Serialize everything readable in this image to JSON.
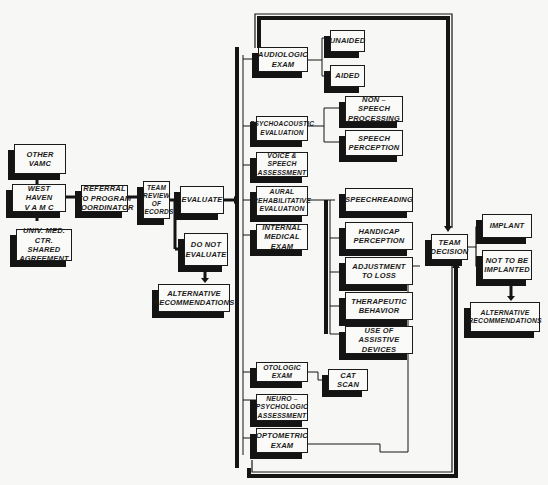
{
  "diagram": {
    "type": "flowchart",
    "colors": {
      "background": "#f7f7f5",
      "ink": "#1a1a1a",
      "box_fill": "#fafaf8"
    },
    "intake": {
      "other_vamc": "OTHER VAMC",
      "west_haven": "WEST HAVEN\nV A M C",
      "univ_med": "UNIV. MED. CTR.\nSHARED\nAGREEMENT",
      "referral": "REFERRAL\nTO PROGRAM\nCOORDINATOR",
      "team_review": "TEAM\nREVIEW\nOF\nRECORDS",
      "evaluate": "EVALUATE",
      "do_not_evaluate": "DO NOT\nEVALUATE",
      "alt_recommendations_1": "ALTERNATIVE\nRECOMMENDATIONS"
    },
    "evaluations": {
      "audiologic": "AUDIOLOGIC\nEXAM",
      "unaided": "UNAIDED",
      "aided": "AIDED",
      "psychoacoustic": "PSYCHOACOUSTIC\nEVALUATION",
      "non_speech": "NON – SPEECH\nPROCESSING",
      "speech_perception": "SPEECH\nPERCEPTION",
      "voice_speech": "VOICE & SPEECH\nASSESSMENT",
      "aural_rehab": "AURAL\nREHABILITATIVE\nEVALUATION",
      "speechreading": "SPEECHREADING",
      "handicap": "HANDICAP\nPERCEPTION",
      "adjustment": "ADJUSTMENT\nTO  LOSS",
      "therapeutic": "THERAPEUTIC\nBEHAVIOR",
      "assistive": "USE OF ASSISTIVE\nDEVICES",
      "internal_medical": "INTERNAL\nMEDICAL EXAM",
      "otologic": "OTOLOGIC EXAM",
      "cat_scan": "CAT SCAN",
      "neuro": "NEURO –\nPSYCHOLOGIC\nASSESSMENT",
      "optometric": "OPTOMETRIC\nEXAM"
    },
    "decision": {
      "team_decision": "TEAM\nDECISION",
      "implant": "IMPLANT",
      "not_implanted": "NOT TO BE\nIMPLANTED",
      "alt_recommendations_2": "ALTERNATIVE\nRECOMMENDATIONS"
    }
  }
}
